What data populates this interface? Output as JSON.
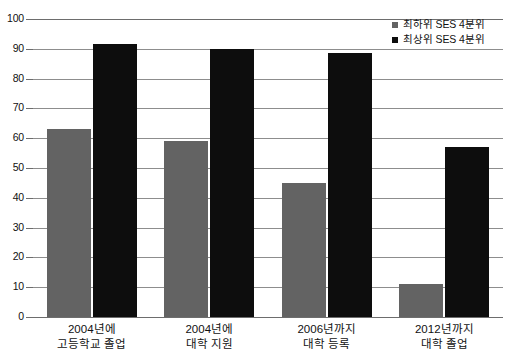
{
  "chart_data": {
    "type": "bar",
    "title": "",
    "subtitle": "",
    "xlabel": "",
    "ylabel": "",
    "ylim": [
      0,
      100
    ],
    "ytick_step": 10,
    "yticks": [
      "100",
      "90",
      "80",
      "70",
      "60",
      "50",
      "40",
      "30",
      "20",
      "10",
      "0"
    ],
    "grid": true,
    "grid_orientation": "horizontal",
    "legend_position": "top-right",
    "categories": [
      "2004년에\n고등학교 졸업",
      "2004년에\n대학 지원",
      "2006년까지\n대학 등록",
      "2012년까지\n대학 졸업"
    ],
    "category_lines": [
      {
        "line1": "2004년에",
        "line2": "고등학교 졸업"
      },
      {
        "line1": "2004년에",
        "line2": "대학 지원"
      },
      {
        "line1": "2006년까지",
        "line2": "대학 등록"
      },
      {
        "line1": "2012년까지",
        "line2": "대학 졸업"
      }
    ],
    "series": [
      {
        "name": "최하위 SES 4분위",
        "color": "#636363",
        "values": [
          63,
          59,
          45,
          11
        ]
      },
      {
        "name": "최상위 SES 4분위",
        "color": "#0d0d0d",
        "values": [
          91.5,
          90,
          88.5,
          57
        ]
      }
    ]
  },
  "legend": {
    "items": [
      {
        "label": "최하위 SES 4분위",
        "marker": "square-marker-gray"
      },
      {
        "label": "최상위 SES 4분위",
        "marker": "square-marker-black"
      }
    ]
  }
}
